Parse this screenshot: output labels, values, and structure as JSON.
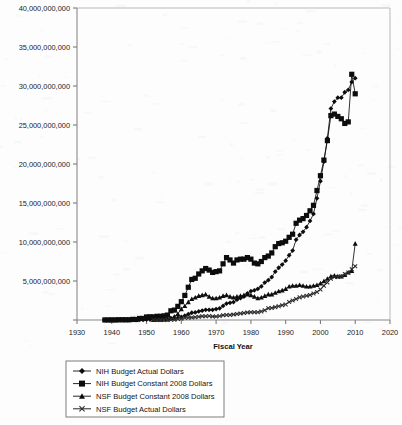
{
  "chart_data": {
    "type": "line",
    "title": "",
    "xlabel": "Fiscal Year",
    "ylabel": "",
    "xlim": [
      1930,
      2020
    ],
    "ylim": [
      0,
      40000000000
    ],
    "xticks": [
      1930,
      1940,
      1950,
      1960,
      1970,
      1980,
      1990,
      2000,
      2010,
      2020
    ],
    "xtick_labels": [
      "1930",
      "1940",
      "1950",
      "1960",
      "1970",
      "1980",
      "1990",
      "2000",
      "2010",
      "2020"
    ],
    "yticks": [
      0,
      5000000000,
      10000000000,
      15000000000,
      20000000000,
      25000000000,
      30000000000,
      35000000000,
      40000000000
    ],
    "ytick_labels": [
      "0",
      "5,000,000,000",
      "10,000,000,000",
      "15,000,000,000",
      "20,000,000,000",
      "25,000,000,000",
      "30,000,000,000",
      "35,000,000,000",
      "40,000,000,000"
    ],
    "grid": false,
    "legend_position": "below-center",
    "series": [
      {
        "name": "NIH Budget Actual Dollars",
        "marker": "diamond",
        "color": "#0d0d0d",
        "x": [
          1938,
          1939,
          1940,
          1941,
          1942,
          1943,
          1944,
          1945,
          1946,
          1947,
          1948,
          1949,
          1950,
          1951,
          1952,
          1953,
          1954,
          1955,
          1956,
          1957,
          1958,
          1959,
          1960,
          1961,
          1962,
          1963,
          1964,
          1965,
          1966,
          1967,
          1968,
          1969,
          1970,
          1971,
          1972,
          1973,
          1974,
          1975,
          1976,
          1977,
          1978,
          1979,
          1980,
          1981,
          1982,
          1983,
          1984,
          1985,
          1986,
          1987,
          1988,
          1989,
          1990,
          1991,
          1992,
          1993,
          1994,
          1995,
          1996,
          1997,
          1998,
          1999,
          2000,
          2001,
          2002,
          2003,
          2004,
          2005,
          2006,
          2007,
          2008,
          2009,
          2010
        ],
        "values": [
          464000,
          464000,
          707000,
          707000,
          2800000,
          3000000,
          3000000,
          3000000,
          8000000,
          8000000,
          26000000,
          26000000,
          52000000,
          59000000,
          59000000,
          71000000,
          71000000,
          81000000,
          98000000,
          190000000,
          211000000,
          294000000,
          400000000,
          544000000,
          738000000,
          930000000,
          974000000,
          1100000000,
          1200000000,
          1300000000,
          1300000000,
          1300000000,
          1400000000,
          1500000000,
          1800000000,
          2100000000,
          2200000000,
          2300000000,
          2600000000,
          2800000000,
          3000000000,
          3400000000,
          3700000000,
          3800000000,
          4000000000,
          4300000000,
          4800000000,
          5100000000,
          5500000000,
          6200000000,
          6700000000,
          7100000000,
          7600000000,
          8300000000,
          8900000000,
          10300000000,
          10900000000,
          11300000000,
          11900000000,
          12700000000,
          13600000000,
          15600000000,
          17800000000,
          20300000000,
          23300000000,
          27100000000,
          28000000000,
          28500000000,
          28500000000,
          29200000000,
          29500000000,
          30500000000,
          31000000000
        ]
      },
      {
        "name": "NIH Budget Constant 2008 Dollars",
        "marker": "square",
        "color": "#0d0d0d",
        "x": [
          1938,
          1939,
          1940,
          1941,
          1942,
          1943,
          1944,
          1945,
          1946,
          1947,
          1948,
          1949,
          1950,
          1951,
          1952,
          1953,
          1954,
          1955,
          1956,
          1957,
          1958,
          1959,
          1960,
          1961,
          1962,
          1963,
          1964,
          1965,
          1966,
          1967,
          1968,
          1969,
          1970,
          1971,
          1972,
          1973,
          1974,
          1975,
          1976,
          1977,
          1978,
          1979,
          1980,
          1981,
          1982,
          1983,
          1984,
          1985,
          1986,
          1987,
          1988,
          1989,
          1990,
          1991,
          1992,
          1993,
          1994,
          1995,
          1996,
          1997,
          1998,
          1999,
          2000,
          2001,
          2002,
          2003,
          2004,
          2005,
          2006,
          2007,
          2008,
          2009,
          2010
        ],
        "values": [
          6800000,
          6800000,
          10000000,
          9000000,
          32000000,
          33000000,
          32000000,
          31000000,
          76000000,
          67000000,
          200000000,
          198000000,
          390000000,
          410000000,
          400000000,
          470000000,
          470000000,
          530000000,
          630000000,
          1180000000,
          1270000000,
          1750000000,
          2350000000,
          3150000000,
          4200000000,
          5200000000,
          5350000000,
          5900000000,
          6300000000,
          6600000000,
          6400000000,
          6100000000,
          6200000000,
          6300000000,
          7200000000,
          8000000000,
          7700000000,
          7300000000,
          7700000000,
          7800000000,
          7800000000,
          8000000000,
          7800000000,
          7300000000,
          7200000000,
          7500000000,
          8000000000,
          8200000000,
          8600000000,
          9400000000,
          9800000000,
          9900000000,
          10100000000,
          10600000000,
          11000000000,
          12400000000,
          12800000000,
          13000000000,
          13400000000,
          14000000000,
          14700000000,
          16600000000,
          18500000000,
          20500000000,
          23000000000,
          26200000000,
          26400000000,
          26100000000,
          25800000000,
          25200000000,
          25400000000,
          31500000000,
          29000000000
        ]
      },
      {
        "name": "NSF Budget Constant 2008 Dollars",
        "marker": "triangle",
        "color": "#0d0d0d",
        "x": [
          1952,
          1953,
          1954,
          1955,
          1956,
          1957,
          1958,
          1959,
          1960,
          1961,
          1962,
          1963,
          1964,
          1965,
          1966,
          1967,
          1968,
          1969,
          1970,
          1971,
          1972,
          1973,
          1974,
          1975,
          1976,
          1977,
          1978,
          1979,
          1980,
          1981,
          1982,
          1983,
          1984,
          1985,
          1986,
          1987,
          1988,
          1989,
          1990,
          1991,
          1992,
          1993,
          1994,
          1995,
          1996,
          1997,
          1998,
          1999,
          2000,
          2001,
          2002,
          2003,
          2004,
          2005,
          2006,
          2007,
          2008,
          2009,
          2010
        ],
        "values": [
          27000000,
          33000000,
          53000000,
          80000000,
          110000000,
          270000000,
          450000000,
          800000000,
          1400000000,
          1800000000,
          2300000000,
          2700000000,
          2900000000,
          3100000000,
          3200000000,
          3300000000,
          3000000000,
          2800000000,
          2800000000,
          2900000000,
          3100000000,
          3200000000,
          3000000000,
          2900000000,
          3000000000,
          3100000000,
          3200000000,
          3300000000,
          3200000000,
          3000000000,
          2800000000,
          2900000000,
          3100000000,
          3300000000,
          3300000000,
          3500000000,
          3700000000,
          3800000000,
          4000000000,
          4300000000,
          4400000000,
          4400000000,
          4500000000,
          4400000000,
          4300000000,
          4300000000,
          4400000000,
          4500000000,
          4700000000,
          5000000000,
          5300000000,
          5600000000,
          5700000000,
          5600000000,
          5600000000,
          5800000000,
          6100000000,
          6300000000,
          9800000000
        ]
      },
      {
        "name": "NSF Budget Actual Dollars",
        "marker": "cross",
        "color": "#2e2e2e",
        "x": [
          1952,
          1953,
          1954,
          1955,
          1956,
          1957,
          1958,
          1959,
          1960,
          1961,
          1962,
          1963,
          1964,
          1965,
          1966,
          1967,
          1968,
          1969,
          1970,
          1971,
          1972,
          1973,
          1974,
          1975,
          1976,
          1977,
          1978,
          1979,
          1980,
          1981,
          1982,
          1983,
          1984,
          1985,
          1986,
          1987,
          1988,
          1989,
          1990,
          1991,
          1992,
          1993,
          1994,
          1995,
          1996,
          1997,
          1998,
          1999,
          2000,
          2001,
          2002,
          2003,
          2004,
          2005,
          2006,
          2007,
          2008,
          2009,
          2010
        ],
        "values": [
          3500000,
          4800000,
          8000000,
          12000000,
          16000000,
          40000000,
          50000000,
          130000000,
          160000000,
          300000000,
          300000000,
          320000000,
          350000000,
          420000000,
          480000000,
          480000000,
          500000000,
          440000000,
          460000000,
          500000000,
          600000000,
          650000000,
          650000000,
          700000000,
          760000000,
          830000000,
          890000000,
          960000000,
          1000000000,
          1000000000,
          1000000000,
          1100000000,
          1250000000,
          1500000000,
          1550000000,
          1650000000,
          1750000000,
          1900000000,
          2000000000,
          2300000000,
          2500000000,
          2700000000,
          2900000000,
          3000000000,
          3100000000,
          3200000000,
          3400000000,
          3600000000,
          3900000000,
          4400000000,
          4800000000,
          5300000000,
          5500000000,
          5500000000,
          5600000000,
          5900000000,
          6100000000,
          6500000000,
          6900000000
        ]
      }
    ]
  },
  "legend": {
    "items": [
      {
        "label": "NIH Budget Actual Dollars",
        "marker": "diamond"
      },
      {
        "label": "NIH Budget Constant 2008 Dollars",
        "marker": "square"
      },
      {
        "label": "NSF Budget Constant 2008 Dollars",
        "marker": "triangle"
      },
      {
        "label": "NSF Budget Actual Dollars",
        "marker": "cross"
      }
    ]
  }
}
